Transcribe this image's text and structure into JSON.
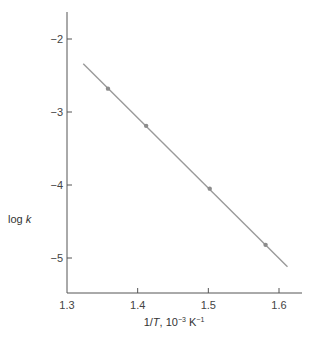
{
  "chart_data": {
    "type": "scatter",
    "title": "",
    "xlabel": "1/T, 10⁻³ K⁻¹",
    "xlabel_parts": {
      "pre": "1/",
      "italic": "T",
      "post": ", 10",
      "sup1": "−3",
      "mid": " K",
      "sup2": "−1"
    },
    "ylabel": "log k",
    "ylabel_parts": {
      "pre": "log ",
      "italic": "k"
    },
    "xlim": [
      1.3,
      1.63
    ],
    "ylim": [
      -5.48,
      -1.63
    ],
    "x_ticks": [
      1.3,
      1.4,
      1.5,
      1.6
    ],
    "x_tick_labels": [
      "1.3",
      "1.4",
      "1.5",
      "1.6"
    ],
    "y_ticks": [
      -2,
      -3,
      -4,
      -5
    ],
    "y_tick_labels": [
      "−2",
      "−3",
      "−4",
      "−5"
    ],
    "grid": false,
    "legend": null,
    "series": [
      {
        "name": "measured",
        "x": [
          1.358,
          1.412,
          1.502,
          1.581
        ],
        "y": [
          -2.68,
          -3.19,
          -4.05,
          -4.82
        ],
        "marker": "circle"
      },
      {
        "name": "fit line",
        "type": "line",
        "x": [
          1.323,
          1.612
        ],
        "y": [
          -2.34,
          -5.12
        ]
      }
    ],
    "colors": {
      "axis": "#555555",
      "line": "#9a9a9a",
      "marker": "#8c8c8c"
    }
  }
}
